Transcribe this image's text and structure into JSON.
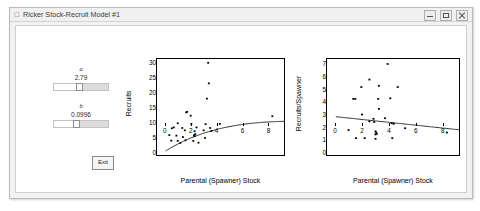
{
  "window": {
    "title": "Ricker Stock-Recruit Model #1",
    "icon": "matlab-figure-icon",
    "buttons": {
      "minimize": "minimize-button",
      "maximize": "maximize-button",
      "close": "close-button"
    }
  },
  "controls": {
    "param_a": {
      "label": "a",
      "value": "2.79",
      "thumb_pct": 41
    },
    "param_b": {
      "label": "b",
      "value": "0.0996",
      "thumb_pct": 36
    },
    "exit_label": "Exit"
  },
  "chart_data": [
    {
      "type": "scatter",
      "title": "",
      "xlabel": "Parental (Spawner) Stock",
      "ylabel": "Recruits",
      "xlim": [
        -0.6,
        9.2
      ],
      "ylim": [
        -1.2,
        31.5
      ],
      "xticks": [
        0,
        2,
        4,
        6,
        8
      ],
      "yticks": [
        0,
        5,
        10,
        15,
        20,
        25,
        30
      ],
      "grid": false,
      "legend": null,
      "points": [
        [
          3.35,
          30.2
        ],
        [
          3.4,
          23.2
        ],
        [
          3.25,
          18.0
        ],
        [
          1.65,
          13.3
        ],
        [
          1.72,
          13.5
        ],
        [
          2.0,
          12.2
        ],
        [
          1.0,
          9.6
        ],
        [
          2.05,
          9.4
        ],
        [
          3.15,
          9.3
        ],
        [
          4.25,
          9.4
        ],
        [
          0.55,
          7.9
        ],
        [
          0.7,
          8.2
        ],
        [
          1.35,
          8.0
        ],
        [
          2.45,
          8.2
        ],
        [
          3.5,
          8.0
        ],
        [
          1.55,
          7.2
        ],
        [
          2.3,
          6.9
        ],
        [
          3.0,
          7.2
        ],
        [
          3.6,
          7.0
        ],
        [
          0.35,
          5.6
        ],
        [
          0.9,
          5.4
        ],
        [
          2.25,
          5.5
        ],
        [
          2.3,
          5.2
        ],
        [
          2.35,
          5.9
        ],
        [
          1.4,
          4.9
        ],
        [
          3.1,
          4.6
        ],
        [
          0.5,
          3.7
        ],
        [
          1.0,
          3.6
        ],
        [
          1.6,
          3.8
        ],
        [
          2.2,
          3.6
        ],
        [
          1.2,
          2.9
        ],
        [
          2.6,
          3.0
        ],
        [
          8.3,
          12.0
        ]
      ],
      "curve": {
        "name": "Ricker fit",
        "model": "R = a*S*exp(-b*S)",
        "a": 2.79,
        "b": 0.0996,
        "color": "#000000"
      }
    },
    {
      "type": "scatter",
      "title": "",
      "xlabel": "Parental (Spawner) Stock",
      "ylabel": "Recruits/Spawner",
      "xlim": [
        -0.6,
        9.2
      ],
      "ylim": [
        -0.3,
        7.4
      ],
      "xticks": [
        0,
        2,
        4,
        6,
        8
      ],
      "yticks": [
        0,
        1,
        2,
        3,
        4,
        5,
        6,
        7
      ],
      "grid": false,
      "legend": null,
      "points": [
        [
          3.9,
          7.0
        ],
        [
          2.55,
          5.75
        ],
        [
          3.25,
          5.25
        ],
        [
          1.95,
          5.15
        ],
        [
          4.65,
          5.15
        ],
        [
          1.35,
          4.2
        ],
        [
          1.5,
          4.2
        ],
        [
          3.2,
          4.2
        ],
        [
          4.1,
          4.25
        ],
        [
          3.25,
          3.4
        ],
        [
          2.0,
          2.95
        ],
        [
          2.85,
          2.6
        ],
        [
          3.7,
          2.65
        ],
        [
          2.55,
          2.4
        ],
        [
          2.9,
          2.35
        ],
        [
          4.2,
          2.25
        ],
        [
          4.35,
          2.2
        ],
        [
          1.0,
          1.7
        ],
        [
          5.2,
          1.85
        ],
        [
          8.3,
          1.5
        ],
        [
          3.0,
          1.6
        ],
        [
          3.05,
          1.5
        ],
        [
          3.1,
          1.4
        ],
        [
          3.0,
          1.35
        ],
        [
          1.55,
          1.05
        ],
        [
          2.2,
          1.05
        ],
        [
          3.0,
          1.0
        ],
        [
          4.25,
          1.05
        ]
      ],
      "curve": {
        "name": "Ricker linearized fit",
        "model": "R/S = a*exp(-b*S)",
        "color": "#000000"
      }
    }
  ]
}
